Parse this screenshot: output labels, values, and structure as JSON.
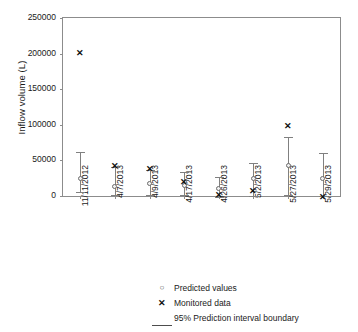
{
  "chart_data": {
    "type": "scatter",
    "title": "",
    "xlabel": "",
    "ylabel": "Inflow volume (L)",
    "ylim": [
      0,
      250000
    ],
    "yticks": [
      0,
      50000,
      100000,
      150000,
      200000,
      250000
    ],
    "ytick_labels": [
      "0",
      "50000",
      "100000",
      "150000",
      "200000",
      "250000"
    ],
    "grid": false,
    "legend_position": "below-axes",
    "categories": [
      "11/11/2012",
      "4/7/2013",
      "4/9/2013",
      "4/17/2013",
      "4/26/2013",
      "5/2/2013",
      "5/27/2013",
      "5/29/2013"
    ],
    "series": [
      {
        "name": "Predicted values",
        "marker": "circle",
        "values": [
          25000,
          13000,
          17000,
          15000,
          10000,
          24000,
          43000,
          25000
        ]
      },
      {
        "name": "Monitored data",
        "marker": "x",
        "values": [
          200000,
          42000,
          37000,
          19000,
          1000,
          6000,
          98000,
          -2000
        ]
      },
      {
        "name": "95% Prediction interval boundary",
        "marker": "line",
        "upper": [
          62000,
          41000,
          37000,
          34000,
          27000,
          46000,
          83000,
          60000
        ],
        "lower": [
          5000,
          1000,
          1000,
          2000,
          -1000,
          0,
          2000,
          0
        ]
      }
    ],
    "legend": [
      {
        "key": "circle-marker",
        "label": "Predicted values"
      },
      {
        "key": "x-marker",
        "label": "Monitored data"
      },
      {
        "key": "line-marker",
        "label": "95% Prediction interval boundary"
      }
    ]
  }
}
